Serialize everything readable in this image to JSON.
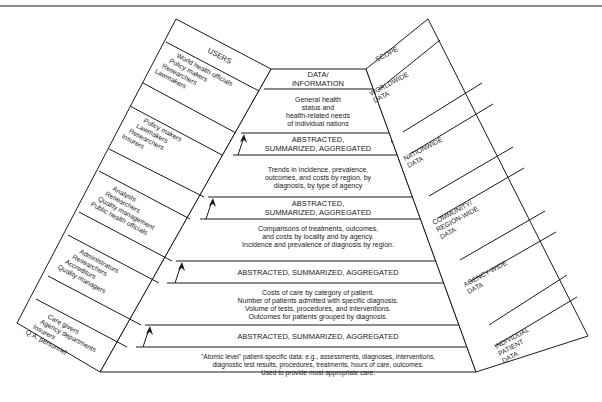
{
  "diagram": {
    "users_header": "USERS",
    "scope_header": "SCOPE",
    "apex": {
      "line1": "DATA/",
      "line2": "INFORMATION"
    },
    "levels": [
      {
        "name": "worldwide",
        "info": [
          "General health",
          "status and",
          "health-related needs",
          "of individual nations"
        ],
        "users": [
          "World health officials",
          "Policy makers",
          "Researchers",
          "Lawmakers"
        ],
        "scope": [
          "WORLDWIDE",
          "DATA"
        ]
      },
      {
        "name": "nationwide",
        "info": [
          "Trends in incidence, prevalence,",
          "outcomes, and costs by region, by",
          "diagnosis, by type of agency"
        ],
        "users": [
          "Policy makers",
          "Lawmakers",
          "Researchers",
          "Insurers"
        ],
        "scope": [
          "NATIONWIDE",
          "DATA"
        ]
      },
      {
        "name": "community",
        "info": [
          "Comparisons of treatments, outcomes,",
          "and costs by locality and by agency.",
          "Incidence and prevalence of diagnosis by region."
        ],
        "users": [
          "Analysts",
          "Researchers",
          "Quality management",
          "Public health officials"
        ],
        "scope": [
          "COMMUNITY/",
          "REGION-WIDE",
          "DATA"
        ]
      },
      {
        "name": "agency",
        "info": [
          "Costs of care by category of patient.",
          "Number of patients admitted with specific diagnosis.",
          "Volume of tests, procedures, and interventions.",
          "Outcomes for patients grouped by diagnosis."
        ],
        "users": [
          "Administrators",
          "Researchers",
          "Accreditors",
          "Quality managers"
        ],
        "scope": [
          "AGENCY-WIDE",
          "DATA"
        ]
      },
      {
        "name": "individual",
        "info": [
          "\"Atomic level\" patient-specific data: e.g., assessments, diagnoses, interventions,",
          "diagnostic test results, procedures, treatments, hours of care, outcomes.",
          "Used to provide most appropriate care."
        ],
        "users": [
          "Care givers",
          "Agency departments",
          "Insurers",
          "Q.A. personnel"
        ],
        "scope": [
          "INDIVIDUAL",
          "PATIENT",
          "DATA"
        ]
      }
    ],
    "transitions": [
      {
        "line1": "ABSTRACTED,",
        "line2": "SUMMARIZED, AGGREGATED"
      },
      {
        "line1": "ABSTRACTED,",
        "line2": "SUMMARIZED, AGGREGATED"
      },
      {
        "line1": "ABSTRACTED, SUMMARIZED, AGGREGATED",
        "line2": ""
      },
      {
        "line1": "ABSTRACTED, SUMMARIZED, AGGREGATED",
        "line2": ""
      }
    ],
    "colors": {
      "line": "#1a1a1a",
      "background": "#ffffff",
      "rule": "#8a8a8a"
    }
  }
}
